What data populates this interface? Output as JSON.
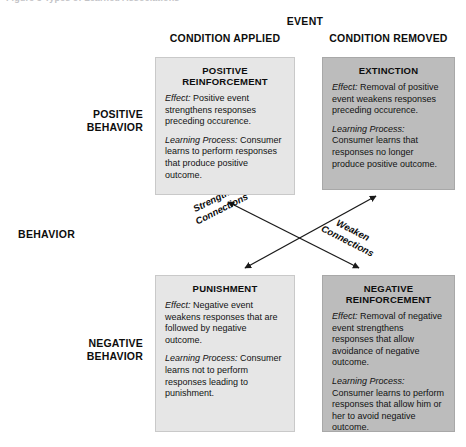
{
  "figure": {
    "caption": "Figure 3    Types of Learned Associations"
  },
  "headers": {
    "event_title": "EVENT",
    "column_left": "CONDITION APPLIED",
    "column_right": "CONDITION REMOVED",
    "behavior_axis": "BEHAVIOR",
    "row_top_line1": "POSITIVE",
    "row_top_line2": "BEHAVIOR",
    "row_bottom_line1": "NEGATIVE",
    "row_bottom_line2": "BEHAVIOR"
  },
  "labels": {
    "effect": "Effect:",
    "learning_process": "Learning Process:"
  },
  "quadrants": {
    "positive_reinforcement": {
      "title_line1": "POSITIVE",
      "title_line2": "REINFORCEMENT",
      "effect": " Positive event strengthens responses preceding occurence.",
      "learning": " Consumer learns to perform responses that produce positive outcome."
    },
    "extinction": {
      "title_line1": "EXTINCTION",
      "title_line2": "",
      "effect": " Removal of positive event weakens responses preceding occurence.",
      "learning": " Consumer learns that responses no longer produce positive outcome."
    },
    "punishment": {
      "title_line1": "PUNISHMENT",
      "title_line2": "",
      "effect": " Negative event weakens responses that are followed by negative outcome.",
      "learning": " Consumer learns not to perform responses leading to punishment."
    },
    "negative_reinforcement": {
      "title_line1": "NEGATIVE",
      "title_line2": "REINFORCEMENT",
      "effect": " Removal of negative event strengthens responses that allow avoidance of negative outcome.",
      "learning": " Consumer learns to perform responses that allow him or her to avoid negative outcome."
    }
  },
  "connectors": {
    "strengthen_line1": "Strengthen",
    "strengthen_line2": "Connections",
    "weaken_line1": "Weaken",
    "weaken_line2": "Connections"
  },
  "colors": {
    "box_light": "#e6e6e6",
    "box_dark": "#bcbcbc",
    "box_border": "#c9c9c9",
    "text": "#121212",
    "arrow": "#1a1a1a"
  }
}
